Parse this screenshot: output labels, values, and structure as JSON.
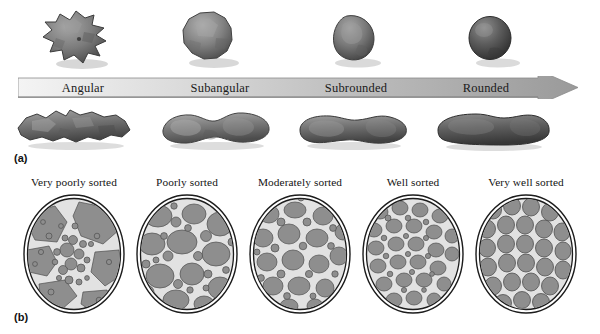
{
  "figure": {
    "background_color": "#ffffff"
  },
  "panel_a": {
    "tag": "(a)",
    "description": "Roundness continuum of sedimentary clasts",
    "arrow": {
      "name": "roundness-gradient-arrow",
      "direction": "left-to-right",
      "gradient_start_color": "#f2f2f2",
      "gradient_end_color": "#9a9a9a",
      "outline_color": "#7d7d7d"
    },
    "labels": [
      {
        "text": "Angular",
        "center_x": 83,
        "clast_color": "#6e6e6e"
      },
      {
        "text": "Subangular",
        "center_x": 220,
        "clast_color": "#737373"
      },
      {
        "text": "Subrounded",
        "center_x": 356,
        "clast_color": "#6a6a6a"
      },
      {
        "text": "Rounded",
        "center_x": 486,
        "clast_color": "#565656"
      }
    ],
    "top_row_clasts": [
      {
        "name": "angular-clast-top",
        "roundness": "Angular"
      },
      {
        "name": "subangular-clast-top",
        "roundness": "Subangular"
      },
      {
        "name": "subrounded-clast-top",
        "roundness": "Subrounded"
      },
      {
        "name": "rounded-clast-top",
        "roundness": "Rounded"
      }
    ],
    "bottom_row_clasts": [
      {
        "name": "angular-clast-bottom",
        "roundness": "Angular"
      },
      {
        "name": "subangular-clast-bottom",
        "roundness": "Subangular"
      },
      {
        "name": "subrounded-clast-bottom",
        "roundness": "Subrounded"
      },
      {
        "name": "rounded-clast-bottom",
        "roundness": "Rounded"
      }
    ]
  },
  "panel_b": {
    "tag": "(b)",
    "description": "Sorting continuum shown in five circular grain views",
    "grain_fill_color": "#8e8e8e",
    "matrix_color": "#d8d8d8",
    "outline_color": "#1c1c1c",
    "cells": [
      {
        "label": "Very poorly sorted",
        "left": 18,
        "sorting": "very-poorly-sorted",
        "grain_size_variation": "extreme"
      },
      {
        "label": "Poorly sorted",
        "left": 131,
        "sorting": "poorly-sorted",
        "grain_size_variation": "high"
      },
      {
        "label": "Moderately sorted",
        "left": 244,
        "sorting": "moderately-sorted",
        "grain_size_variation": "medium"
      },
      {
        "label": "Well sorted",
        "left": 357,
        "sorting": "well-sorted",
        "grain_size_variation": "low"
      },
      {
        "label": "Very well sorted",
        "left": 470,
        "sorting": "very-well-sorted",
        "grain_size_variation": "minimal"
      }
    ]
  }
}
